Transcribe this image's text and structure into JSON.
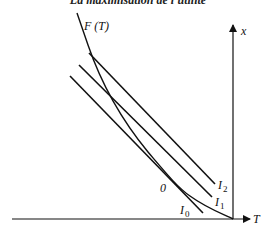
{
  "title": "La maximisation de l'utilité",
  "axes": {
    "x_axis_label": "T",
    "y_axis_label": "x"
  },
  "curves": {
    "frontier_label": "F (T)",
    "indifference": [
      {
        "name": "I",
        "sub": "0"
      },
      {
        "name": "I",
        "sub": "1"
      },
      {
        "name": "I",
        "sub": "2"
      }
    ]
  },
  "point_label": "0",
  "colors": {
    "line": "#111111",
    "background": "#ffffff"
  }
}
